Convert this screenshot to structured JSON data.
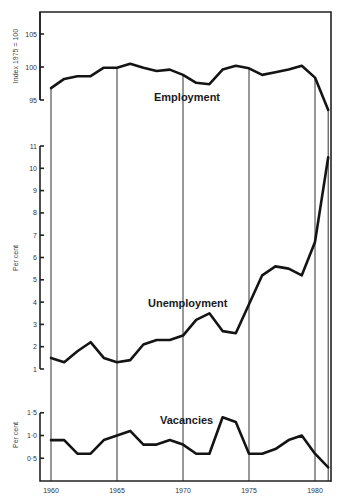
{
  "chart_data": [
    {
      "type": "line",
      "title": "Employment",
      "series_label": "Employment",
      "ylabel": "Index 1975 = 100",
      "xlabel": "",
      "x": [
        1960,
        1961,
        1962,
        1963,
        1964,
        1965,
        1966,
        1967,
        1968,
        1969,
        1970,
        1971,
        1972,
        1973,
        1974,
        1975,
        1976,
        1977,
        1978,
        1979,
        1980,
        1981
      ],
      "values": [
        96.8,
        98.2,
        98.6,
        98.6,
        99.9,
        99.9,
        100.5,
        99.9,
        99.4,
        99.6,
        98.8,
        97.6,
        97.4,
        99.6,
        100.2,
        99.8,
        98.8,
        99.2,
        99.6,
        100.2,
        98.4,
        93.5
      ],
      "yticks": [
        "95",
        "100",
        "105"
      ],
      "ylim": [
        95,
        106.5
      ],
      "grid": false
    },
    {
      "type": "line",
      "title": "Unemployment",
      "series_label": "Unemployment",
      "ylabel": "Per cent",
      "xlabel": "",
      "x": [
        1960,
        1961,
        1962,
        1963,
        1964,
        1965,
        1966,
        1967,
        1968,
        1969,
        1970,
        1971,
        1972,
        1973,
        1974,
        1975,
        1976,
        1977,
        1978,
        1979,
        1980,
        1981
      ],
      "values": [
        1.5,
        1.3,
        1.8,
        2.2,
        1.5,
        1.3,
        1.4,
        2.1,
        2.3,
        2.3,
        2.5,
        3.2,
        3.5,
        2.7,
        2.6,
        3.9,
        5.2,
        5.6,
        5.5,
        5.2,
        6.7,
        10.5
      ],
      "yticks": [
        "1",
        "2",
        "3",
        "4",
        "5",
        "6",
        "7",
        "8",
        "9",
        "10",
        "11"
      ],
      "ylim": [
        1,
        11
      ],
      "grid": false
    },
    {
      "type": "line",
      "title": "Vacancies",
      "series_label": "Vacancies",
      "ylabel": "Per cent",
      "xlabel": "",
      "x": [
        1960,
        1961,
        1962,
        1963,
        1964,
        1965,
        1966,
        1967,
        1968,
        1969,
        1970,
        1971,
        1972,
        1973,
        1974,
        1975,
        1976,
        1977,
        1978,
        1979,
        1980,
        1981
      ],
      "values": [
        0.9,
        0.9,
        0.6,
        0.6,
        0.9,
        1.0,
        1.1,
        0.8,
        0.8,
        0.9,
        0.8,
        0.6,
        0.6,
        1.4,
        1.3,
        0.6,
        0.6,
        0.7,
        0.9,
        1.0,
        0.6,
        0.3
      ],
      "yticks": [
        "0·5",
        "1·0",
        "1·5"
      ],
      "ylim": [
        0,
        1.5
      ],
      "grid": false
    }
  ],
  "x_axis": {
    "tick_labels": [
      "1960",
      "1965",
      "1970",
      "1975",
      "1980"
    ],
    "tick_years": [
      1960,
      1965,
      1970,
      1975,
      1980
    ],
    "range": [
      1960,
      1981
    ]
  },
  "style": {
    "line_color": "#141414",
    "axis_color": "#222222",
    "background": "#ffffff"
  }
}
